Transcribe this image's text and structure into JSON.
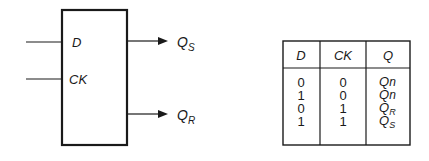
{
  "block": {
    "inputs": [
      {
        "label": "D"
      },
      {
        "label": "CK"
      }
    ],
    "outputs": [
      {
        "label": "Q",
        "sub": "S"
      },
      {
        "label": "Q",
        "sub": "R"
      }
    ]
  },
  "truth_table": {
    "headers": [
      "D",
      "CK",
      "Q"
    ],
    "rows": [
      {
        "d": "0",
        "ck": "0",
        "q": "Q",
        "q_sub": "n"
      },
      {
        "d": "1",
        "ck": "0",
        "q": "Q",
        "q_sub": "n"
      },
      {
        "d": "0",
        "ck": "1",
        "q": "Q",
        "q_sub": "R"
      },
      {
        "d": "1",
        "ck": "1",
        "q": "Q",
        "q_sub": "S"
      }
    ]
  },
  "colors": {
    "line": "#1a1a1a",
    "background": "#ffffff"
  }
}
